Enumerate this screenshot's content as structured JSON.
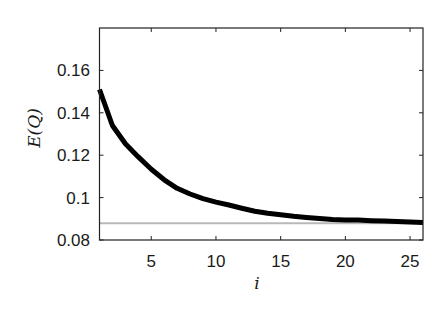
{
  "chart_data": {
    "type": "line",
    "title": "",
    "xlabel": "i",
    "ylabel": "E(Q)",
    "xlim": [
      1,
      26
    ],
    "ylim": [
      0.08,
      0.18
    ],
    "xticks": [
      5,
      10,
      15,
      20,
      25
    ],
    "xtick_labels": [
      "5",
      "10",
      "15",
      "20",
      "25"
    ],
    "yticks": [
      0.08,
      0.1,
      0.12,
      0.14,
      0.16
    ],
    "ytick_labels": [
      "0.08",
      "0.1",
      "0.12",
      "0.14",
      "0.16"
    ],
    "grid": false,
    "legend": null,
    "x": [
      1,
      2,
      3,
      4,
      5,
      6,
      7,
      8,
      9,
      10,
      11,
      12,
      13,
      14,
      15,
      16,
      17,
      18,
      19,
      20,
      21,
      22,
      23,
      24,
      25,
      26
    ],
    "series": [
      {
        "name": "E(Q)",
        "color": "#000000",
        "line_width": 5,
        "values": [
          0.151,
          0.134,
          0.1254,
          0.1192,
          0.1134,
          0.1084,
          0.1044,
          0.1017,
          0.0995,
          0.0979,
          0.0965,
          0.095,
          0.0936,
          0.0926,
          0.0919,
          0.0912,
          0.0906,
          0.0901,
          0.0896,
          0.0895,
          0.0894,
          0.0891,
          0.0889,
          0.0887,
          0.0885,
          0.0883
        ]
      },
      {
        "name": "reference",
        "color": "#b8b8b8",
        "line_width": 2,
        "values": [
          0.0879,
          0.0879,
          0.0879,
          0.0879,
          0.0879,
          0.0879,
          0.0879,
          0.0879,
          0.0879,
          0.0879,
          0.0879,
          0.0879,
          0.0879,
          0.0879,
          0.0879,
          0.0879,
          0.0879,
          0.0879,
          0.0879,
          0.0879,
          0.0879,
          0.0879,
          0.0879,
          0.0879,
          0.0879,
          0.0879
        ]
      }
    ]
  }
}
